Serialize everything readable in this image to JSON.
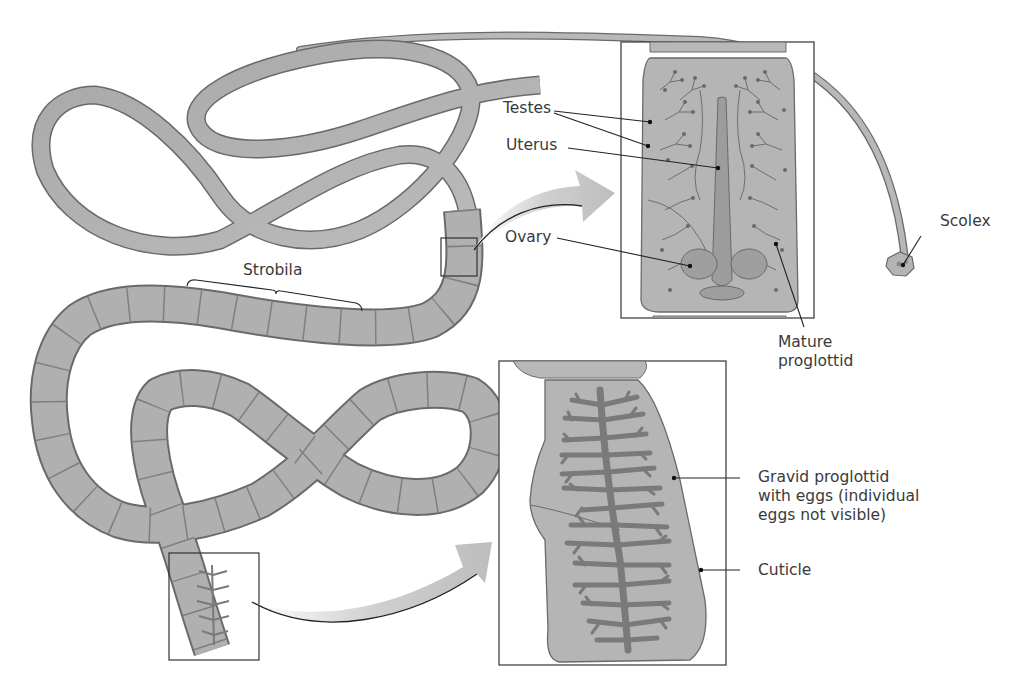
{
  "figure": {
    "colors": {
      "background": "#ffffff",
      "body_fill": "#b4b4b4",
      "body_dark": "#8e8e8e",
      "outline": "#6a6a6a",
      "branch_fill": "#7c7c7c",
      "label_text": "#3a3a3a",
      "leader_line": "#222222",
      "arrow_fill": "#c8c8c8"
    }
  },
  "labels": {
    "strobila": "Strobila",
    "testes": "Testes",
    "uterus": "Uterus",
    "ovary": "Ovary",
    "scolex": "Scolex",
    "mature_line1": "Mature",
    "mature_line2": "proglottid",
    "gravid_line1": "Gravid proglottid",
    "gravid_line2": "with eggs (individual",
    "gravid_line3": "eggs not visible)",
    "cuticle": "Cuticle"
  },
  "insets": [
    {
      "name": "mature-proglottid-inset",
      "source_box": [
        441,
        238,
        36,
        38
      ],
      "inset_box": [
        621,
        42,
        193,
        276
      ]
    },
    {
      "name": "gravid-proglottid-inset",
      "source_box": [
        169,
        553,
        90,
        107
      ],
      "inset_box": [
        499,
        361,
        227,
        304
      ]
    }
  ]
}
